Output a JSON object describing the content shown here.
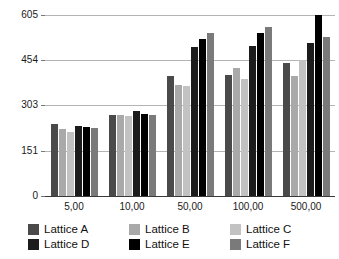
{
  "chart_data": {
    "type": "bar",
    "title": "",
    "xlabel": "",
    "ylabel": "",
    "categories": [
      "5,00",
      "10,00",
      "50,00",
      "100,00",
      "500,00"
    ],
    "yticks": [
      0,
      151,
      303,
      454,
      605
    ],
    "ylim": [
      0,
      605
    ],
    "grid": true,
    "legend_position": "bottom",
    "series": [
      {
        "name": "Lattice A",
        "color": "#4a4a4a",
        "values": [
          240,
          272,
          400,
          405,
          443
        ]
      },
      {
        "name": "Lattice B",
        "color": "#a9a9a9",
        "values": [
          225,
          272,
          372,
          428,
          400
        ]
      },
      {
        "name": "Lattice C",
        "color": "#c2c2c2",
        "values": [
          215,
          268,
          368,
          390,
          455
        ]
      },
      {
        "name": "Lattice D",
        "color": "#1c1c1c",
        "values": [
          235,
          285,
          497,
          500,
          510
        ]
      },
      {
        "name": "Lattice E",
        "color": "#000000",
        "values": [
          230,
          275,
          525,
          545,
          605
        ]
      },
      {
        "name": "Lattice F",
        "color": "#7a7a7a",
        "values": [
          228,
          272,
          545,
          565,
          530
        ]
      }
    ]
  },
  "legend": {
    "items": [
      {
        "label": "Lattice A",
        "color": "#4a4a4a"
      },
      {
        "label": "Lattice B",
        "color": "#a9a9a9"
      },
      {
        "label": "Lattice C",
        "color": "#c2c2c2"
      },
      {
        "label": "Lattice D",
        "color": "#1c1c1c"
      },
      {
        "label": "Lattice E",
        "color": "#000000"
      },
      {
        "label": "Lattice F",
        "color": "#7a7a7a"
      }
    ]
  }
}
